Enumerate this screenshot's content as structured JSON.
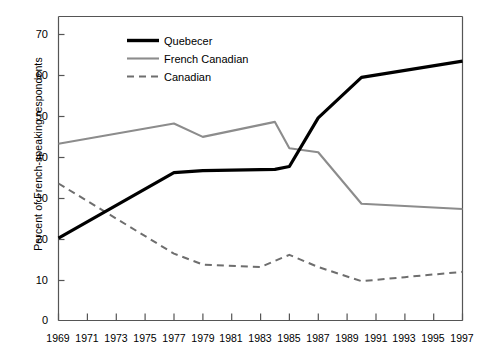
{
  "chart_data": {
    "type": "line",
    "title": "",
    "xlabel": "",
    "ylabel": "Percent of French-speaking respondents",
    "xlim": [
      1969,
      1997
    ],
    "ylim": [
      0,
      75
    ],
    "y_ticks": [
      0,
      10,
      20,
      30,
      40,
      50,
      60,
      70
    ],
    "x_ticks": [
      1969,
      1971,
      1973,
      1975,
      1977,
      1979,
      1981,
      1983,
      1985,
      1987,
      1989,
      1991,
      1993,
      1995,
      1997
    ],
    "grid": false,
    "legend_position": "top-center",
    "series": [
      {
        "name": "Quebecer",
        "style": "solid-thick-black",
        "color": "#000000",
        "x": [
          1969,
          1977,
          1979,
          1984,
          1985,
          1987,
          1990,
          1997
        ],
        "values": [
          20.3,
          36.5,
          37.0,
          37.3,
          38.0,
          50.0,
          60.0,
          64.0
        ]
      },
      {
        "name": "French Canadian",
        "style": "solid-thin-gray",
        "color": "#8c8c8c",
        "x": [
          1969,
          1977,
          1979,
          1984,
          1985,
          1987,
          1990,
          1997
        ],
        "values": [
          43.6,
          48.6,
          45.3,
          49.0,
          42.5,
          41.5,
          28.8,
          27.5
        ]
      },
      {
        "name": "Canadian",
        "style": "dashed-gray",
        "color": "#6e6e6e",
        "x": [
          1969,
          1977,
          1979,
          1983,
          1985,
          1987,
          1990,
          1993,
          1997
        ],
        "values": [
          33.8,
          16.5,
          13.8,
          13.2,
          16.2,
          13.2,
          9.7,
          10.7,
          12.0
        ]
      }
    ]
  },
  "axis": {
    "y_tick_labels": [
      "70",
      "60",
      "50",
      "40",
      "30",
      "20",
      "10",
      "0"
    ],
    "y_axis_title": "Percent of French-speaking respondents",
    "x_tick_labels": [
      "1969",
      "1971",
      "1973",
      "1975",
      "1977",
      "1979",
      "1981",
      "1983",
      "1985",
      "1987",
      "1989",
      "1991",
      "1993",
      "1995",
      "1997"
    ]
  },
  "legend": {
    "items": [
      {
        "label": "Quebecer",
        "swatch": "thick-black-line-icon"
      },
      {
        "label": "French Canadian",
        "swatch": "thin-gray-line-icon"
      },
      {
        "label": "Canadian",
        "swatch": "dashed-gray-line-icon"
      }
    ]
  },
  "colors": {
    "quebecer": "#000000",
    "french_canadian": "#8c8c8c",
    "canadian": "#6e6e6e",
    "axis": "#555555"
  }
}
